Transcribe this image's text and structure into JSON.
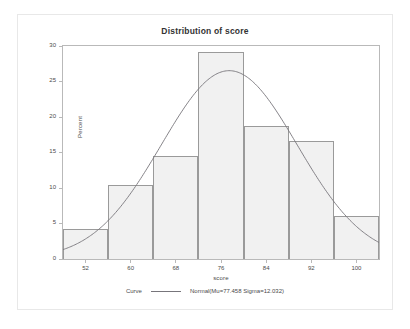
{
  "chart_data": {
    "type": "bar",
    "title": "Distribution of score",
    "xlabel": "score",
    "ylabel": "Percent",
    "xlim": [
      48,
      104
    ],
    "ylim": [
      0,
      30
    ],
    "grid": false,
    "bin_width": 8,
    "x_ticks": [
      52,
      60,
      68,
      76,
      84,
      92,
      100
    ],
    "y_ticks": [
      0,
      5,
      10,
      15,
      20,
      25,
      30
    ],
    "categories": [
      "48-56",
      "56-64",
      "64-72",
      "72-80",
      "80-88",
      "88-96",
      "96-104"
    ],
    "bin_edges": [
      48,
      56,
      64,
      72,
      80,
      88,
      96,
      104
    ],
    "bin_midpoints": [
      52,
      60,
      68,
      76,
      84,
      92,
      100
    ],
    "values": [
      4.2,
      10.4,
      14.5,
      29.1,
      18.7,
      16.6,
      6.1
    ],
    "series": [
      {
        "name": "Percent",
        "values": [
          4.2,
          10.4,
          14.5,
          29.1,
          18.7,
          16.6,
          6.1
        ]
      },
      {
        "name": "Normal(Mu=77.458 Sigma=12.032)",
        "type": "line",
        "mu": 77.458,
        "sigma": 12.032,
        "bin_width": 8,
        "peak_percent": 26.5
      }
    ],
    "legend": {
      "position": "bottom",
      "title": "Curve",
      "entries": [
        "Normal(Mu=77.458 Sigma=12.032)"
      ]
    },
    "colors": {
      "bar_fill": "#f1f1f1",
      "bar_border": "#9a9a9a",
      "curve": "#77757b",
      "axis": "#b9b9b9",
      "text": "#4a4a4a",
      "title_text": "#333333"
    }
  },
  "axes": {
    "y_title": "Percent",
    "x_title": "score",
    "y_tick_labels": [
      "0",
      "5",
      "10",
      "15",
      "20",
      "25",
      "30"
    ],
    "x_tick_labels": [
      "52",
      "60",
      "68",
      "76",
      "84",
      "92",
      "100"
    ]
  },
  "title": "Distribution of score",
  "legend": {
    "curve_label": "Curve",
    "normal_label": "Normal(Mu=77.458 Sigma=12.032)"
  }
}
